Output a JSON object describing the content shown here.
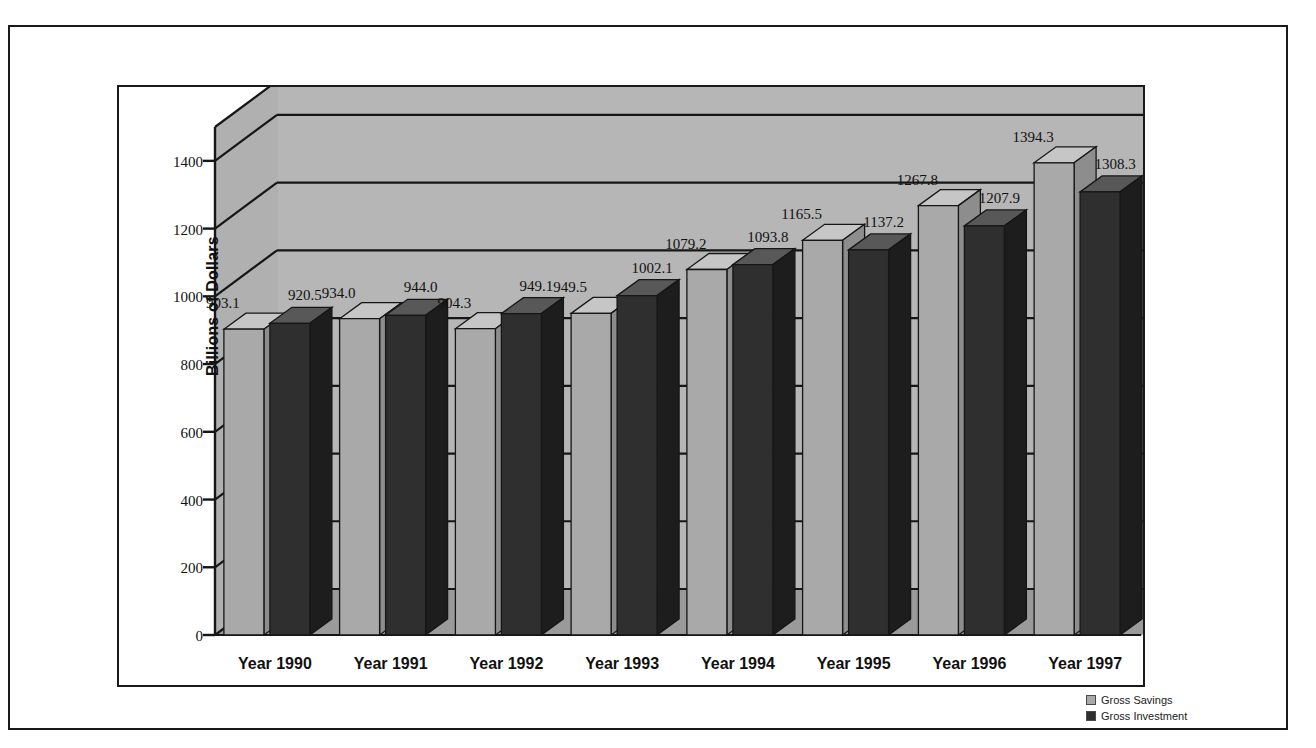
{
  "chart_data": {
    "type": "bar",
    "title": "",
    "subtitle": "",
    "xlabel": "",
    "ylabel": "Billions of Dollars",
    "categories": [
      "Year 1990",
      "Year 1991",
      "Year 1992",
      "Year 1993",
      "Year 1994",
      "Year 1995",
      "Year 1996",
      "Year 1997"
    ],
    "series": [
      {
        "name": "Gross Savings",
        "color": "#a9a9a9",
        "values": [
          903.1,
          934.0,
          904.3,
          949.5,
          1079.2,
          1165.5,
          1267.8,
          1394.3
        ]
      },
      {
        "name": "Gross Investment",
        "color": "#2f2f2f",
        "values": [
          920.5,
          944.0,
          949.1,
          1002.1,
          1093.8,
          1137.2,
          1207.9,
          1308.3
        ]
      }
    ],
    "value_labels": [
      [
        "903.1",
        "920.5"
      ],
      [
        "934.0",
        "944.0"
      ],
      [
        "904.3",
        "949.1"
      ],
      [
        "949.5",
        "1002.1"
      ],
      [
        "1079.2",
        "1093.8"
      ],
      [
        "1165.5",
        "1137.2"
      ],
      [
        "1267.8",
        "1207.9"
      ],
      [
        "1394.3",
        "1308.3"
      ]
    ],
    "yticks": [
      "0",
      "200",
      "400",
      "600",
      "800",
      "1000",
      "1200",
      "1400"
    ],
    "ytick_values": [
      0,
      200,
      400,
      600,
      800,
      1000,
      1200,
      1400
    ],
    "ylim": [
      0,
      1500
    ],
    "grid": true,
    "legend_position": "bottom-right",
    "projection": "3d-bar"
  },
  "legend": {
    "items": [
      {
        "label": "Gross Savings",
        "color": "#a9a9a9"
      },
      {
        "label": "Gross Investment",
        "color": "#2f2f2f"
      }
    ]
  },
  "colors": {
    "back_wall": "#b6b6b6",
    "side_wall": "#b0b0b0",
    "floor": "#9a9a9a",
    "gridline": "#161616",
    "savings_front": "#a9a9a9",
    "savings_top": "#c6c6c6",
    "savings_side": "#8d8d8d",
    "investment_front": "#2f2f2f",
    "investment_top": "#585858",
    "investment_side": "#1d1d1d",
    "border": "#1a1a1a",
    "text": "#111111"
  }
}
